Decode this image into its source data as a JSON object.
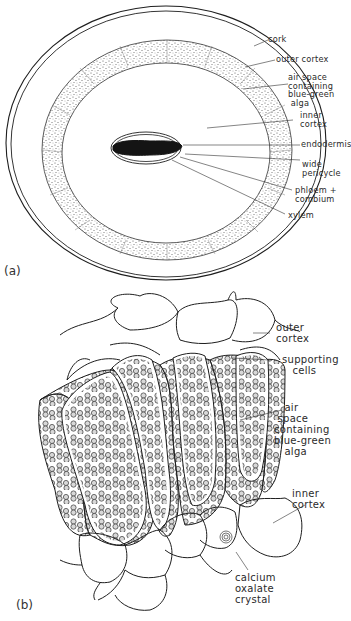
{
  "figure": {
    "panel_a": {
      "letter": "(a)",
      "labels": {
        "cork": "cork",
        "outer_cortex": "outer cortex",
        "air_space": "air space\ncontaining\nblue-green\n alga",
        "inner_cortex": "inner\ncortex",
        "endodermis": "endodermis",
        "wide_pericycle": "wide\npericycle",
        "phloem_cambium": "phloem +\ncombium",
        "xylem": "xylem"
      }
    },
    "panel_b": {
      "letter": "(b)",
      "labels": {
        "outer_cortex": "outer\ncortex",
        "supporting_cells": "supporting\n   cells",
        "air_space": "   air\n space\ncontaining\nblue-green\n   alga",
        "inner_cortex": "inner\ncortex",
        "calcium_oxalate": "calcium\noxalate\ncrystal"
      }
    },
    "colors": {
      "line": "#1e1e1e",
      "stipple": "#555555",
      "stele": "#141414",
      "background": "#ffffff"
    }
  }
}
